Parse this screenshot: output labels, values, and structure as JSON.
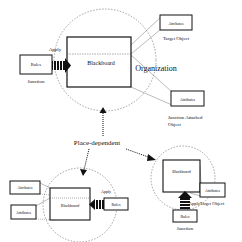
{
  "diagram": {
    "center_label": "Place-dependent",
    "organization": {
      "title": "Organization",
      "blackboard_label": "Blackboard",
      "rules_label": "Rules",
      "junction_label": "Junction",
      "apply_label": "Apply",
      "target_attributes_label": "Attributes",
      "target_object_label": "Target Object",
      "junction_attributes_label": "Attributes",
      "junction_attached_line1": "Junction Attached",
      "junction_attached_line2": "Object"
    },
    "bottom_left": {
      "blackboard_label": "Blackboard",
      "attributes_1_label": "Attributes",
      "attributes_2_label": "Attributes",
      "rules_label": "Rules",
      "apply_label": "Apply"
    },
    "bottom_right": {
      "blackboard_label": "Blackboard",
      "attributes_label": "Attributes",
      "target_object_label": "Target Object",
      "rules_label": "Rules",
      "junction_label": "Junction",
      "apply_label": "Apply"
    }
  }
}
